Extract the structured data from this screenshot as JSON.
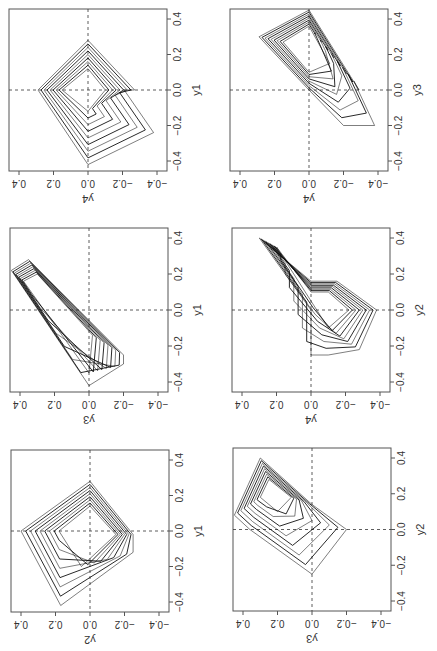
{
  "chart_data": [
    {
      "type": "line",
      "panel": "row1-col1",
      "horizontal_axis": {
        "label": "y4",
        "ticks": [
          "0.4",
          "0.2",
          "0.0",
          "-0.2",
          "-0.4"
        ],
        "range": [
          0.45,
          -0.45
        ]
      },
      "vertical_axis": {
        "label": "y1",
        "ticks": [
          "-0.4",
          "-0.2",
          "0.0",
          "0.2",
          "0.4"
        ],
        "range": [
          -0.45,
          0.45
        ]
      },
      "reference_lines": {
        "h": 0,
        "v": 0,
        "style": "dashed"
      },
      "description": "Nested diamond-shaped trajectories, y4 (horizontal) vs y1 (vertical)",
      "series": [
        {
          "name": "outer",
          "points": [
            [
              0.0,
              -0.42
            ],
            [
              0.29,
              0.0
            ],
            [
              0.0,
              0.28
            ],
            [
              -0.27,
              0.0
            ],
            [
              -0.21,
              0.0
            ],
            [
              -0.38,
              -0.24
            ],
            [
              0.0,
              -0.42
            ]
          ]
        },
        {
          "name": "inner",
          "points": [
            [
              0.0,
              -0.12
            ],
            [
              0.15,
              0.0
            ],
            [
              0.0,
              0.12
            ],
            [
              -0.1,
              0.0
            ],
            [
              0.0,
              -0.12
            ]
          ]
        }
      ]
    },
    {
      "type": "line",
      "panel": "row1-col2",
      "horizontal_axis": {
        "label": "y4",
        "ticks": [
          "0.4",
          "0.2",
          "0.0",
          "-0.2",
          "-0.4"
        ],
        "range": [
          0.45,
          -0.45
        ]
      },
      "vertical_axis": {
        "label": "y3",
        "ticks": [
          "-0.4",
          "-0.2",
          "0.0",
          "0.2",
          "0.4"
        ],
        "range": [
          -0.45,
          0.45
        ]
      },
      "reference_lines": {
        "h": 0,
        "v": 0,
        "style": "dashed"
      },
      "description": "Elongated kite trajectories, y4 (horizontal) vs y3 (vertical)",
      "series": [
        {
          "name": "outer",
          "points": [
            [
              0.0,
              0.45
            ],
            [
              0.29,
              0.3
            ],
            [
              0.0,
              0.0
            ],
            [
              -0.2,
              -0.2
            ],
            [
              -0.38,
              -0.2
            ],
            [
              -0.26,
              0.05
            ],
            [
              -0.29,
              0.0
            ],
            [
              0.0,
              0.45
            ]
          ]
        },
        {
          "name": "inner",
          "points": [
            [
              0.0,
              0.36
            ],
            [
              0.15,
              0.27
            ],
            [
              0.0,
              0.1
            ],
            [
              -0.12,
              0.15
            ],
            [
              0.0,
              0.36
            ]
          ]
        }
      ]
    },
    {
      "type": "line",
      "panel": "row2-col1",
      "horizontal_axis": {
        "label": "y3",
        "ticks": [
          "0.4",
          "0.2",
          "0.0",
          "-0.2",
          "-0.4"
        ],
        "range": [
          0.45,
          -0.45
        ]
      },
      "vertical_axis": {
        "label": "y1",
        "ticks": [
          "-0.4",
          "-0.2",
          "0.0",
          "0.2",
          "0.4"
        ],
        "range": [
          -0.45,
          0.45
        ]
      },
      "reference_lines": {
        "h": 0,
        "v": 0,
        "style": "dashed"
      },
      "description": "Narrow wedge trajectories, y3 (horizontal) vs y1 (vertical)",
      "series": [
        {
          "name": "outer",
          "points": [
            [
              0.45,
              0.22
            ],
            [
              0.35,
              0.28
            ],
            [
              -0.2,
              -0.25
            ],
            [
              -0.2,
              -0.3
            ],
            [
              0.0,
              -0.42
            ],
            [
              0.45,
              0.22
            ]
          ]
        },
        {
          "name": "inner",
          "points": [
            [
              0.38,
              0.16
            ],
            [
              0.3,
              0.2
            ],
            [
              -0.02,
              -0.14
            ],
            [
              0.0,
              -0.35
            ],
            [
              0.38,
              0.16
            ]
          ]
        }
      ]
    },
    {
      "type": "line",
      "panel": "row2-col2",
      "horizontal_axis": {
        "label": "y4",
        "ticks": [
          "0.4",
          "0.2",
          "0.0",
          "-0.2",
          "-0.4"
        ],
        "range": [
          0.45,
          -0.45
        ]
      },
      "vertical_axis": {
        "label": "y2",
        "ticks": [
          "-0.4",
          "-0.2",
          "0.0",
          "0.2",
          "0.4"
        ],
        "range": [
          -0.45,
          0.45
        ]
      },
      "reference_lines": {
        "h": 0,
        "v": 0,
        "style": "dashed"
      },
      "description": "Arrow/chevron shaped trajectories, y4 (horizontal) vs y2 (vertical)",
      "series": [
        {
          "name": "outer",
          "points": [
            [
              0.3,
              0.4
            ],
            [
              0.0,
              0.16
            ],
            [
              -0.15,
              0.16
            ],
            [
              -0.38,
              0.0
            ],
            [
              -0.28,
              -0.22
            ],
            [
              -0.1,
              -0.25
            ],
            [
              0.0,
              -0.25
            ],
            [
              0.0,
              0.0
            ],
            [
              0.3,
              0.4
            ]
          ]
        },
        {
          "name": "inner",
          "points": [
            [
              0.2,
              0.35
            ],
            [
              0.0,
              0.1
            ],
            [
              -0.1,
              0.1
            ],
            [
              -0.22,
              0.0
            ],
            [
              -0.1,
              -0.1
            ],
            [
              0.0,
              0.05
            ],
            [
              0.2,
              0.35
            ]
          ]
        }
      ]
    },
    {
      "type": "line",
      "panel": "row3-col1",
      "horizontal_axis": {
        "label": "y2",
        "ticks": [
          "0.4",
          "0.2",
          "0.0",
          "-0.2",
          "-0.4"
        ],
        "range": [
          0.45,
          -0.45
        ]
      },
      "vertical_axis": {
        "label": "y1",
        "ticks": [
          "-0.4",
          "-0.2",
          "0.0",
          "0.2",
          "0.4"
        ],
        "range": [
          -0.45,
          0.45
        ]
      },
      "reference_lines": {
        "h": 0,
        "v": 0,
        "style": "dashed"
      },
      "description": "Nested square/diamond trajectories, y2 (horizontal) vs y1 (vertical)",
      "series": [
        {
          "name": "outer",
          "points": [
            [
              0.4,
              0.0
            ],
            [
              0.0,
              0.28
            ],
            [
              -0.25,
              -0.02
            ],
            [
              -0.25,
              -0.12
            ],
            [
              0.17,
              -0.42
            ],
            [
              0.4,
              0.0
            ]
          ]
        },
        {
          "name": "inner",
          "points": [
            [
              0.18,
              0.0
            ],
            [
              0.0,
              0.14
            ],
            [
              -0.15,
              -0.02
            ],
            [
              0.05,
              -0.2
            ],
            [
              0.18,
              0.0
            ]
          ]
        }
      ]
    },
    {
      "type": "line",
      "panel": "row3-col2",
      "horizontal_axis": {
        "label": "y3",
        "ticks": [
          "0.4",
          "0.2",
          "0.0",
          "-0.2",
          "-0.4"
        ],
        "range": [
          0.45,
          -0.45
        ]
      },
      "vertical_axis": {
        "label": "y2",
        "ticks": [
          "-0.4",
          "-0.2",
          "0.0",
          "0.2",
          "0.4"
        ],
        "range": [
          -0.45,
          0.45
        ]
      },
      "reference_lines": {
        "h": 0,
        "v": 0,
        "style": "dashed"
      },
      "description": "Square trajectory with nested corner loops, y3 (horizontal) vs y2 (vertical)",
      "series": [
        {
          "name": "outer",
          "points": [
            [
              0.45,
              0.08
            ],
            [
              0.3,
              0.4
            ],
            [
              0.0,
              0.14
            ],
            [
              -0.2,
              0.0
            ],
            [
              0.0,
              -0.25
            ],
            [
              0.36,
              0.0
            ],
            [
              0.45,
              0.08
            ]
          ]
        },
        {
          "name": "inner",
          "points": [
            [
              0.3,
              0.18
            ],
            [
              0.25,
              0.28
            ],
            [
              0.12,
              0.18
            ],
            [
              0.2,
              0.1
            ],
            [
              0.3,
              0.18
            ]
          ]
        }
      ]
    }
  ],
  "panels": [
    {
      "h_label": "y4",
      "v_label": "y1"
    },
    {
      "h_label": "y4",
      "v_label": "y3"
    },
    {
      "h_label": "y3",
      "v_label": "y1"
    },
    {
      "h_label": "y4",
      "v_label": "y2"
    },
    {
      "h_label": "y2",
      "v_label": "y1"
    },
    {
      "h_label": "y3",
      "v_label": "y2"
    }
  ],
  "tick_labels": {
    "h": [
      "0.4",
      "0.2",
      "0.0",
      "−0.2",
      "−0.4"
    ],
    "v": [
      "−0.4",
      "−0.2",
      "0.0",
      "0.2",
      "0.4"
    ]
  }
}
